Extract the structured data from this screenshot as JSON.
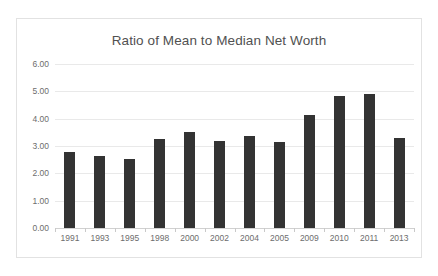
{
  "chart_data": {
    "type": "bar",
    "title": "Ratio of Mean to Median Net Worth",
    "xlabel": "",
    "ylabel": "",
    "categories": [
      "1991",
      "1993",
      "1995",
      "1998",
      "2000",
      "2002",
      "2004",
      "2005",
      "2009",
      "2010",
      "2011",
      "2013"
    ],
    "values": [
      2.79,
      2.64,
      2.54,
      3.25,
      3.52,
      3.17,
      3.38,
      3.15,
      4.12,
      4.83,
      4.92,
      3.3
    ],
    "ylim": [
      0,
      6
    ],
    "ytick_labels": [
      "6.00",
      "5.00",
      "4.00",
      "3.00",
      "2.00",
      "1.00",
      "0.00"
    ],
    "ytick_values": [
      6,
      5,
      4,
      3,
      2,
      1,
      0
    ],
    "grid": true,
    "legend": false,
    "series": [
      {
        "name": "Ratio of Mean to Median Net Worth",
        "values": [
          2.79,
          2.64,
          2.54,
          3.25,
          3.52,
          3.17,
          3.38,
          3.15,
          4.12,
          4.83,
          4.92,
          3.3
        ]
      }
    ],
    "colors": {
      "bar": "#333333",
      "grid": "#e9e9e9",
      "axis": "#d0d0d0",
      "text": "#6d6d6d",
      "title": "#515151",
      "frame": "#e2e2e2",
      "background": "#ffffff"
    }
  }
}
